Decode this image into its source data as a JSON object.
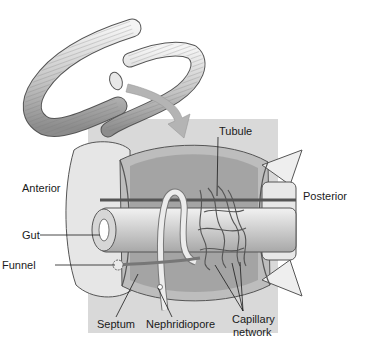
{
  "figure": {
    "colors": {
      "background": "#ffffff",
      "panel": "#d9d9d9",
      "arrow": "#b4b4b4",
      "ink": "#1a1a1a",
      "tissue": "#ececec",
      "shade": "#9a9a9a"
    }
  },
  "labels": {
    "anterior": "Anterior",
    "posterior": "Posterior",
    "gut": "Gut",
    "funnel": "Funnel",
    "septum": "Septum",
    "nephridiopore": "Nephridiopore",
    "tubule": "Tubule",
    "capillary_line1": "Capillary",
    "capillary_line2": "network"
  }
}
